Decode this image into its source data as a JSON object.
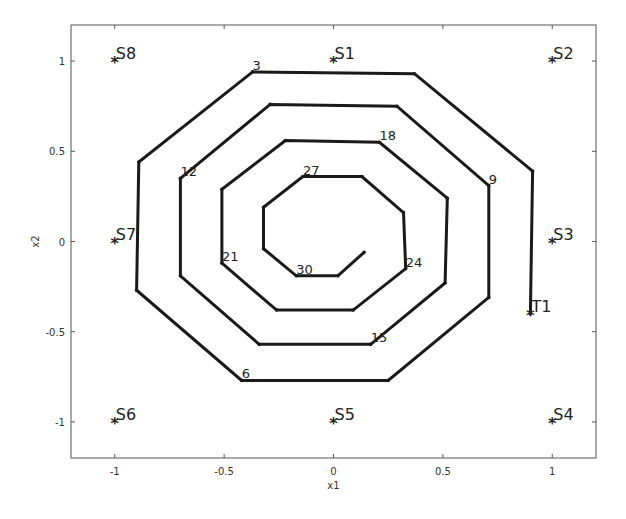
{
  "chart_data": {
    "type": "line",
    "title": "",
    "xlabel": "x1",
    "ylabel": "x2",
    "xlim": [
      -1.2,
      1.2
    ],
    "ylim": [
      -1.2,
      1.2
    ],
    "grid": false,
    "legend": null,
    "xticks": [
      -1,
      -0.5,
      0,
      0.5,
      1
    ],
    "xtick_labels": [
      "-1",
      "-0.5",
      "0",
      "0.5",
      "1"
    ],
    "yticks": [
      -1,
      -0.5,
      0,
      0.5,
      1
    ],
    "ytick_labels": [
      "-1",
      "-0.5",
      "0",
      "0.5",
      "1"
    ],
    "stations": [
      {
        "name": "S1",
        "x": 0,
        "y": 1
      },
      {
        "name": "S2",
        "x": 1,
        "y": 1
      },
      {
        "name": "S3",
        "x": 1,
        "y": 0
      },
      {
        "name": "S4",
        "x": 1,
        "y": -1
      },
      {
        "name": "S5",
        "x": 0,
        "y": -1
      },
      {
        "name": "S6",
        "x": -1,
        "y": -1
      },
      {
        "name": "S7",
        "x": -1,
        "y": 0
      },
      {
        "name": "S8",
        "x": -1,
        "y": 1
      },
      {
        "name": "T1",
        "x": 0.9,
        "y": -0.4
      }
    ],
    "series": [
      {
        "name": "trajectory",
        "color": "#1a1a1a",
        "line_width": 3,
        "points": [
          {
            "i": 0,
            "x": 0.9,
            "y": -0.4
          },
          {
            "i": 1,
            "x": 0.91,
            "y": 0.39
          },
          {
            "i": 2,
            "x": 0.37,
            "y": 0.93
          },
          {
            "i": 3,
            "x": -0.37,
            "y": 0.94
          },
          {
            "i": 4,
            "x": -0.89,
            "y": 0.44
          },
          {
            "i": 5,
            "x": -0.9,
            "y": -0.27
          },
          {
            "i": 6,
            "x": -0.42,
            "y": -0.77
          },
          {
            "i": 7,
            "x": 0.25,
            "y": -0.77
          },
          {
            "i": 8,
            "x": 0.71,
            "y": -0.31
          },
          {
            "i": 9,
            "x": 0.71,
            "y": 0.31
          },
          {
            "i": 10,
            "x": 0.29,
            "y": 0.75
          },
          {
            "i": 11,
            "x": -0.29,
            "y": 0.76
          },
          {
            "i": 12,
            "x": -0.7,
            "y": 0.35
          },
          {
            "i": 13,
            "x": -0.7,
            "y": -0.19
          },
          {
            "i": 14,
            "x": -0.34,
            "y": -0.57
          },
          {
            "i": 15,
            "x": 0.17,
            "y": -0.57
          },
          {
            "i": 16,
            "x": 0.51,
            "y": -0.23
          },
          {
            "i": 17,
            "x": 0.52,
            "y": 0.24
          },
          {
            "i": 18,
            "x": 0.21,
            "y": 0.55
          },
          {
            "i": 19,
            "x": -0.22,
            "y": 0.56
          },
          {
            "i": 20,
            "x": -0.51,
            "y": 0.29
          },
          {
            "i": 21,
            "x": -0.51,
            "y": -0.12
          },
          {
            "i": 22,
            "x": -0.26,
            "y": -0.38
          },
          {
            "i": 23,
            "x": 0.09,
            "y": -0.38
          },
          {
            "i": 24,
            "x": 0.33,
            "y": -0.15
          },
          {
            "i": 25,
            "x": 0.32,
            "y": 0.16
          },
          {
            "i": 26,
            "x": 0.13,
            "y": 0.36
          },
          {
            "i": 27,
            "x": -0.14,
            "y": 0.36
          },
          {
            "i": 28,
            "x": -0.32,
            "y": 0.19
          },
          {
            "i": 29,
            "x": -0.32,
            "y": -0.04
          },
          {
            "i": 30,
            "x": -0.17,
            "y": -0.19
          },
          {
            "i": 31,
            "x": 0.02,
            "y": -0.19
          },
          {
            "i": 32,
            "x": 0.14,
            "y": -0.06
          }
        ]
      }
    ],
    "annotations": [
      {
        "text": "3",
        "x": -0.37,
        "y": 0.94
      },
      {
        "text": "6",
        "x": -0.42,
        "y": -0.77
      },
      {
        "text": "9",
        "x": 0.71,
        "y": 0.31
      },
      {
        "text": "12",
        "x": -0.7,
        "y": 0.35
      },
      {
        "text": "15",
        "x": 0.17,
        "y": -0.57
      },
      {
        "text": "18",
        "x": 0.21,
        "y": 0.55
      },
      {
        "text": "21",
        "x": -0.51,
        "y": -0.12
      },
      {
        "text": "24",
        "x": 0.33,
        "y": -0.15
      },
      {
        "text": "27",
        "x": -0.14,
        "y": 0.36
      },
      {
        "text": "30",
        "x": -0.17,
        "y": -0.19
      }
    ]
  },
  "layout": {
    "plot_box": {
      "left": 71,
      "top": 25,
      "right": 596,
      "bottom": 458
    },
    "marker_glyph": "*",
    "axis_color": "#555555",
    "background": "#ffffff"
  }
}
